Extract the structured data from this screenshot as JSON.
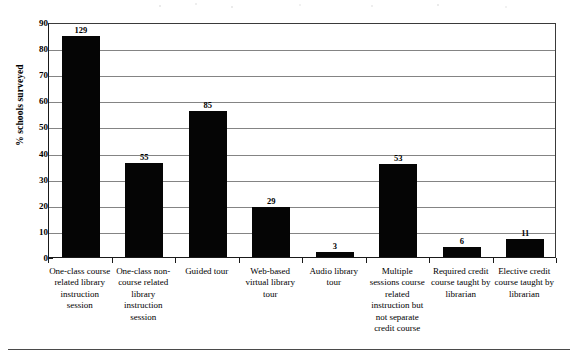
{
  "chart_data": {
    "type": "bar",
    "title": "",
    "subtitle": "",
    "xlabel": "",
    "ylabel": "% schools surveyed",
    "ylim": [
      0,
      90
    ],
    "ytick_step": 10,
    "ytick_labels": [
      "0",
      "10",
      "20",
      "30",
      "40",
      "50",
      "60",
      "70",
      "80",
      "90"
    ],
    "grid": true,
    "legend": false,
    "legend_position": "none",
    "orientation": "vertical",
    "bar_color": "#050505",
    "categories": [
      "One-class course related library instruction session",
      "One-class non-course related library instruction session",
      "Guided tour",
      "Web-based virtual library tour",
      "Audio library tour",
      "Multiple sessions course related instruction but not separate credit course",
      "Required credit course taught by librarian",
      "Elective credit course taught by librarian"
    ],
    "category_lines": [
      [
        "One-class course",
        "related library",
        "instruction",
        "session"
      ],
      [
        "One-class non-",
        "course related",
        "library",
        "instruction",
        "session"
      ],
      [
        "Guided tour"
      ],
      [
        "Web-based",
        "virtual library",
        "tour"
      ],
      [
        "Audio library",
        "tour"
      ],
      [
        "Multiple",
        "sessions course",
        "related",
        "instruction but",
        "not separate",
        "credit course"
      ],
      [
        "Required credit",
        "course taught by",
        "librarian"
      ],
      [
        "Elective credit",
        "course taught by",
        "librarian"
      ]
    ],
    "values": [
      84.5,
      36.0,
      56.0,
      19.0,
      2.0,
      35.5,
      4.0,
      7.0
    ],
    "data_labels": [
      "129",
      "55",
      "85",
      "29",
      "3",
      "53",
      "6",
      "11"
    ],
    "data_label_meaning": "count of schools"
  }
}
